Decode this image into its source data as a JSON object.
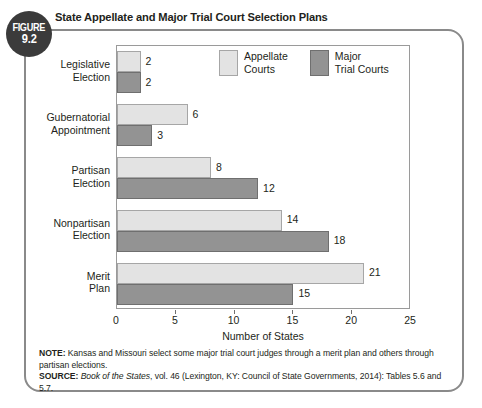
{
  "figure": {
    "badge_word": "FIGURE",
    "badge_number": "9.2",
    "title": "State Appellate and Major Trial Court Selection Plans"
  },
  "legend": {
    "items": [
      {
        "label": "Appellate\nCourts",
        "swatch": "light-swatch",
        "color": "#e3e3e3"
      },
      {
        "label": "Major\nTrial Courts",
        "swatch": "dark-swatch",
        "color": "#939393"
      }
    ]
  },
  "axis": {
    "x_title": "Number of States",
    "x_ticks": [
      "0",
      "5",
      "10",
      "15",
      "20",
      "25"
    ]
  },
  "footnotes": {
    "note_label": "NOTE:",
    "note_text": " Kansas and Missouri select some major trial court judges through a merit plan and others through partisan elections.",
    "source_label": "SOURCE:",
    "source_pre": " ",
    "source_title": "Book of the States",
    "source_post": ", vol. 46 (Lexington, KY: Council of State Governments, 2014): Tables 5.6 and 5.7."
  },
  "chart_data": {
    "type": "bar",
    "orientation": "horizontal",
    "title": "State Appellate and Major Trial Court Selection Plans",
    "xlabel": "Number of States",
    "ylabel": "",
    "xlim": [
      0,
      25
    ],
    "xticks": [
      0,
      5,
      10,
      15,
      20,
      25
    ],
    "grid": false,
    "legend_position": "top-center-inside",
    "categories": [
      "Legislative Election",
      "Gubernatorial Appointment",
      "Partisan Election",
      "Nonpartisan Election",
      "Merit Plan"
    ],
    "category_lines": [
      [
        "Legislative",
        "Election"
      ],
      [
        "Gubernatorial",
        "Appointment"
      ],
      [
        "Partisan",
        "Election"
      ],
      [
        "Nonpartisan",
        "Election"
      ],
      [
        "Merit",
        "Plan"
      ]
    ],
    "series": [
      {
        "name": "Appellate Courts",
        "color": "#e3e3e3",
        "values": [
          2,
          6,
          8,
          14,
          21
        ]
      },
      {
        "name": "Major Trial Courts",
        "color": "#939393",
        "values": [
          2,
          3,
          12,
          18,
          15
        ]
      }
    ]
  }
}
